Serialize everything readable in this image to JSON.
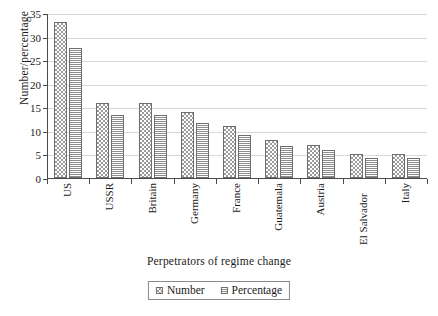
{
  "chart_data": {
    "type": "bar",
    "title": "",
    "xlabel": "Perpetrators of regime change",
    "ylabel": "Number/percentage",
    "categories": [
      "US",
      "USSR",
      "Britain",
      "Germany",
      "France",
      "Guatemala",
      "Austria",
      "El Salvador",
      "Italy"
    ],
    "series": [
      {
        "name": "Number",
        "values": [
          33,
          16,
          16,
          14,
          11,
          8,
          7,
          5,
          5
        ]
      },
      {
        "name": "Percentage",
        "values": [
          27.5,
          13.3,
          13.3,
          11.7,
          9.2,
          6.7,
          5.9,
          4.2,
          4.2
        ]
      }
    ],
    "ylim": [
      0,
      35
    ],
    "yticks": [
      "0",
      "5",
      "10",
      "15",
      "20",
      "25",
      "30",
      "35"
    ],
    "grid": true,
    "legend_position": "bottom"
  },
  "legend": {
    "entries": [
      {
        "label": "Number",
        "pattern": "checkerboard"
      },
      {
        "label": "Percentage",
        "pattern": "horizontal-lines"
      }
    ]
  },
  "colors": {
    "axis": "#4a4a4a",
    "gridline": "#d8d8d8",
    "bar_outline": "#6e6e6e",
    "pattern_fill": "#9a9a9a",
    "background": "#ffffff"
  }
}
